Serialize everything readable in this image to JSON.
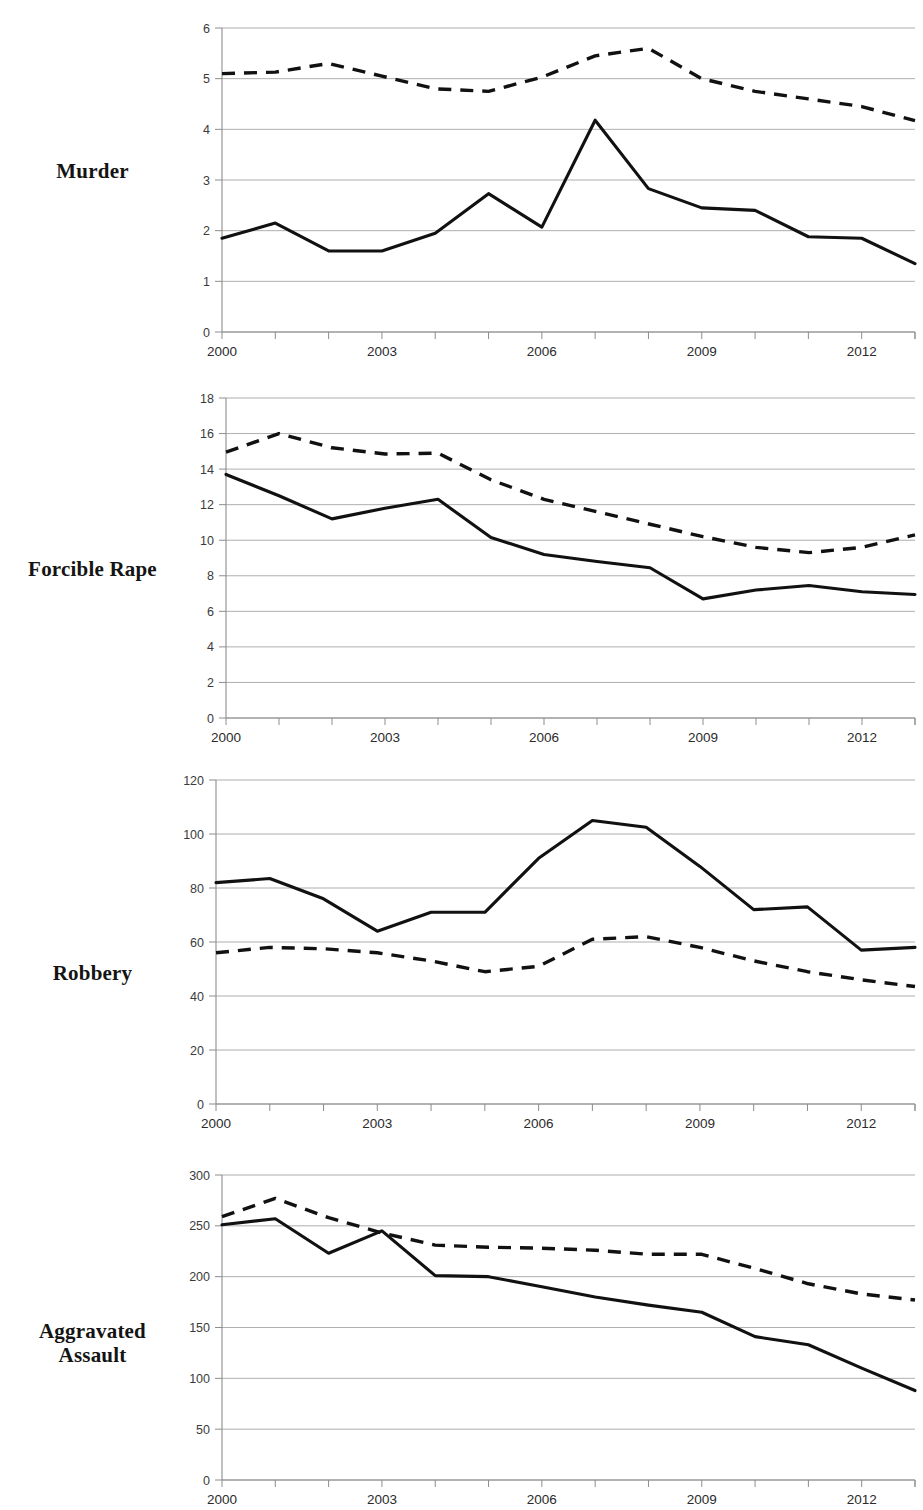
{
  "document": {
    "cropped_header_fragment": "",
    "panel_labels": [
      "Murder",
      "Forcible Rape",
      "Robbery",
      "Aggravated Assault"
    ]
  },
  "panels": [
    {
      "id": "murder",
      "label": "Murder",
      "label_lines": [
        "Murder"
      ],
      "y_ticks": [
        "0",
        "1",
        "2",
        "3",
        "4",
        "5",
        "6"
      ],
      "x_ticks": [
        "2000",
        "2003",
        "2006",
        "2009",
        "2012"
      ]
    },
    {
      "id": "forcible-rape",
      "label": "Forcible Rape",
      "label_lines": [
        "Forcible Rape"
      ],
      "y_ticks": [
        "0",
        "2",
        "4",
        "6",
        "8",
        "10",
        "12",
        "14",
        "16",
        "18"
      ],
      "x_ticks": [
        "2000",
        "2003",
        "2006",
        "2009",
        "2012"
      ]
    },
    {
      "id": "robbery",
      "label": "Robbery",
      "label_lines": [
        "Robbery"
      ],
      "y_ticks": [
        "0",
        "20",
        "40",
        "60",
        "80",
        "100",
        "120"
      ],
      "x_ticks": [
        "2000",
        "2003",
        "2006",
        "2009",
        "2012"
      ]
    },
    {
      "id": "aggravated-assault",
      "label": "Aggravated Assault",
      "label_lines": [
        "Aggravated",
        "Assault"
      ],
      "y_ticks": [
        "0",
        "50",
        "100",
        "150",
        "200",
        "250",
        "300"
      ],
      "x_ticks": [
        "2000",
        "2003",
        "2006",
        "2009",
        "2012"
      ]
    }
  ],
  "chart_data": [
    {
      "type": "line",
      "id": "murder",
      "title": "Murder",
      "xlabel": "",
      "ylabel": "",
      "x": [
        2000,
        2001,
        2002,
        2003,
        2004,
        2005,
        2006,
        2007,
        2008,
        2009,
        2010,
        2011,
        2012,
        2013
      ],
      "xlim": [
        2000,
        2013
      ],
      "ylim": [
        0,
        6
      ],
      "yticks": [
        0,
        1,
        2,
        3,
        4,
        5,
        6
      ],
      "xticks": [
        2000,
        2003,
        2006,
        2009,
        2012
      ],
      "grid": "horizontal",
      "legend": "none",
      "series": [
        {
          "name": "solid-line",
          "style": "solid",
          "values": [
            1.85,
            2.15,
            1.6,
            1.6,
            1.95,
            2.73,
            2.07,
            4.18,
            2.83,
            2.45,
            2.4,
            1.88,
            1.85,
            1.35
          ]
        },
        {
          "name": "dashed-line",
          "style": "dashed",
          "values": [
            5.1,
            5.13,
            5.3,
            5.05,
            4.8,
            4.75,
            5.03,
            5.45,
            5.6,
            5.0,
            4.75,
            4.6,
            4.45,
            4.17
          ]
        }
      ]
    },
    {
      "type": "line",
      "id": "forcible-rape",
      "title": "Forcible Rape",
      "xlabel": "",
      "ylabel": "",
      "x": [
        2000,
        2001,
        2002,
        2003,
        2004,
        2005,
        2006,
        2007,
        2008,
        2009,
        2010,
        2011,
        2012,
        2013
      ],
      "xlim": [
        2000,
        2013
      ],
      "ylim": [
        0,
        18
      ],
      "yticks": [
        0,
        2,
        4,
        6,
        8,
        10,
        12,
        14,
        16,
        18
      ],
      "xticks": [
        2000,
        2003,
        2006,
        2009,
        2012
      ],
      "grid": "horizontal",
      "legend": "none",
      "series": [
        {
          "name": "solid-line",
          "style": "solid",
          "values": [
            13.7,
            12.5,
            11.2,
            11.8,
            12.3,
            10.15,
            9.2,
            8.8,
            8.45,
            6.7,
            7.2,
            7.45,
            7.1,
            6.95
          ]
        },
        {
          "name": "dashed-line",
          "style": "dashed",
          "values": [
            14.95,
            16.0,
            15.2,
            14.85,
            14.9,
            13.4,
            12.3,
            11.6,
            10.9,
            10.2,
            9.6,
            9.3,
            9.6,
            10.3
          ]
        }
      ],
      "note": "solid line ends at 10.3 in final year (sharp rise)"
    },
    {
      "type": "line",
      "id": "robbery",
      "title": "Robbery",
      "xlabel": "",
      "ylabel": "",
      "x": [
        2000,
        2001,
        2002,
        2003,
        2004,
        2005,
        2006,
        2007,
        2008,
        2009,
        2010,
        2011,
        2012,
        2013
      ],
      "xlim": [
        2000,
        2013
      ],
      "ylim": [
        0,
        120
      ],
      "yticks": [
        0,
        20,
        40,
        60,
        80,
        100,
        120
      ],
      "xticks": [
        2000,
        2003,
        2006,
        2009,
        2012
      ],
      "grid": "horizontal",
      "legend": "none",
      "series": [
        {
          "name": "solid-line",
          "style": "solid",
          "values": [
            82,
            83.5,
            76,
            64,
            71,
            71,
            91,
            105,
            102.5,
            88,
            72,
            73,
            57,
            58
          ]
        },
        {
          "name": "dashed-line",
          "style": "dashed",
          "values": [
            56,
            58,
            57.5,
            56,
            53,
            49,
            51,
            61,
            62,
            58,
            53,
            49,
            46,
            43.5
          ]
        }
      ]
    },
    {
      "type": "line",
      "id": "aggravated-assault",
      "title": "Aggravated Assault",
      "xlabel": "",
      "ylabel": "",
      "x": [
        2000,
        2001,
        2002,
        2003,
        2004,
        2005,
        2006,
        2007,
        2008,
        2009,
        2010,
        2011,
        2012,
        2013
      ],
      "xlim": [
        2000,
        2013
      ],
      "ylim": [
        0,
        300
      ],
      "yticks": [
        0,
        50,
        100,
        150,
        200,
        250,
        300
      ],
      "xticks": [
        2000,
        2003,
        2006,
        2009,
        2012
      ],
      "grid": "horizontal",
      "legend": "none",
      "series": [
        {
          "name": "solid-line",
          "style": "solid",
          "values": [
            251,
            257,
            223,
            245,
            201,
            200,
            190,
            180,
            172,
            165,
            141,
            133,
            110,
            88
          ]
        },
        {
          "name": "dashed-line",
          "style": "dashed",
          "values": [
            259,
            277,
            258,
            243,
            231,
            229,
            228,
            226,
            222,
            222,
            208,
            193,
            183,
            177
          ]
        }
      ]
    }
  ],
  "style": {
    "line_color": "#111111",
    "grid_color": "#9a9a9a",
    "background": "#ffffff"
  }
}
